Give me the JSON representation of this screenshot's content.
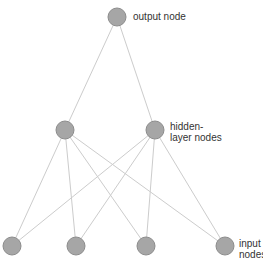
{
  "diagram": {
    "type": "neural-network",
    "colors": {
      "node_fill": "#a6a6a6",
      "node_stroke": "#8c8c8c",
      "edge": "#cccccc",
      "text": "#333333"
    },
    "nodes": {
      "output": [
        {
          "id": "o1",
          "x": 117,
          "y": 17
        }
      ],
      "hidden": [
        {
          "id": "h1",
          "x": 65,
          "y": 130
        },
        {
          "id": "h2",
          "x": 155,
          "y": 130
        }
      ],
      "input": [
        {
          "id": "i1",
          "x": 12,
          "y": 246
        },
        {
          "id": "i2",
          "x": 76,
          "y": 246
        },
        {
          "id": "i3",
          "x": 146,
          "y": 246
        },
        {
          "id": "i4",
          "x": 225,
          "y": 246
        }
      ]
    },
    "labels": {
      "output": "output node",
      "hidden": "hidden-\nlayer nodes",
      "input": "input\nnodes"
    }
  }
}
